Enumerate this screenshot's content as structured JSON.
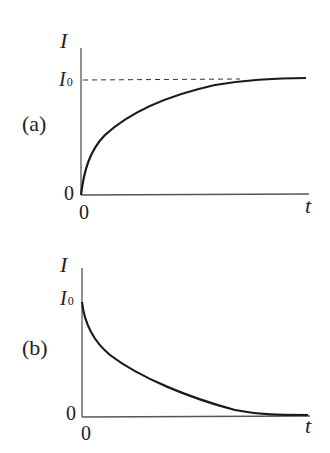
{
  "panels": [
    {
      "id": "a",
      "label": "(a)",
      "y_axis_label": "I",
      "x_axis_label": "t",
      "y_tick_top": "I",
      "y_tick_top_sub": "0",
      "y_origin": "0",
      "x_origin": "0",
      "description": "Current rises from 0 and asymptotically approaches I0 (dashed reference line at I0)"
    },
    {
      "id": "b",
      "label": "(b)",
      "y_axis_label": "I",
      "x_axis_label": "t",
      "y_tick_top": "I",
      "y_tick_top_sub": "0",
      "y_origin": "0",
      "x_origin": "0",
      "description": "Current starts at I0 and decays exponentially toward 0"
    }
  ],
  "colors": {
    "curve": "#1a1a1a",
    "axis": "#444444",
    "text": "#222222"
  }
}
